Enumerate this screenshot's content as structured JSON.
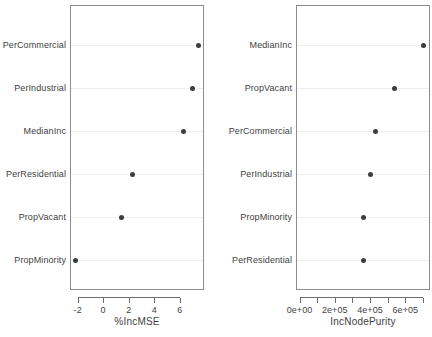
{
  "chart_data": [
    {
      "type": "scatter",
      "panel": "left",
      "title": "",
      "xlabel": "%IncMSE",
      "ylabel": "",
      "grid": true,
      "legend": null,
      "xlim": [
        -2.6,
        7.9
      ],
      "xticks": [
        -2,
        0,
        2,
        4,
        6
      ],
      "xticklabels": [
        "-2",
        "0",
        "2",
        "4",
        "6"
      ],
      "categories": [
        "PerCommercial",
        "PerIndustrial",
        "MedianInc",
        "PerResidential",
        "PropVacant",
        "PropMinority"
      ],
      "values": [
        7.5,
        6.96,
        6.32,
        2.32,
        1.4,
        -2.16
      ]
    },
    {
      "type": "scatter",
      "panel": "right",
      "title": "",
      "xlabel": "IncNodePurity",
      "ylabel": "",
      "grid": true,
      "legend": null,
      "xlim": [
        -20000,
        740000
      ],
      "xticks": [
        0,
        100000,
        200000,
        300000,
        400000,
        500000,
        600000,
        700000
      ],
      "xticklabels": [
        "0e+00",
        "",
        "2e+05",
        "",
        "4e+05",
        "",
        "6e+05",
        ""
      ],
      "labeled_ticks": [
        {
          "value": 0,
          "label": "0e+00"
        },
        {
          "value": 200000,
          "label": "2e+05"
        },
        {
          "value": 400000,
          "label": "4e+05"
        },
        {
          "value": 600000,
          "label": "6e+05"
        }
      ],
      "categories": [
        "MedianInc",
        "PropVacant",
        "PerCommercial",
        "PerIndustrial",
        "PropMinority",
        "PerResidential"
      ],
      "values": [
        703000,
        541000,
        430000,
        404000,
        362000,
        363000
      ]
    }
  ],
  "style": {
    "point_color": "#3d3d3d",
    "panel_border_color": "#8c8c8c",
    "grid_color": "#efefef",
    "axis_color": "#6e6e6e",
    "text_color": "#3f3f3f",
    "background": "#ffffff"
  }
}
